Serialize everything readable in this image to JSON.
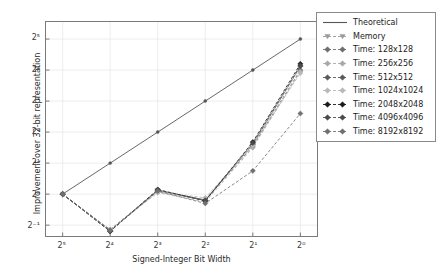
{
  "figure": {
    "background_color": "#ffffff",
    "axes_color": "#7a7a7a",
    "grid_color": "#e8e8e8"
  },
  "axis": {
    "xlabel": "Signed-Integer Bit Width",
    "ylabel": "Improvement over 32-bit representation",
    "xticks": [
      "2⁵",
      "2⁴",
      "2³",
      "2²",
      "2¹",
      "2⁰"
    ],
    "yticks": [
      "2⁵",
      "2⁴",
      "2³",
      "2²",
      "2¹",
      "2⁰",
      "2⁻¹"
    ]
  },
  "legend": {
    "position": "upper-right",
    "entries": [
      {
        "label": "Theoretical",
        "marker": "line",
        "color": "#555555"
      },
      {
        "label": "Memory",
        "marker": "triangle",
        "color": "#9a9a9a"
      },
      {
        "label": "Time: 128x128",
        "marker": "diamond",
        "color": "#6e6e6e"
      },
      {
        "label": "Time: 256x256",
        "marker": "diamond",
        "color": "#a8a8a8"
      },
      {
        "label": "Time: 512x512",
        "marker": "diamond",
        "color": "#5a5a5a"
      },
      {
        "label": "Time: 1024x1024",
        "marker": "diamond",
        "color": "#b8b8b8"
      },
      {
        "label": "Time: 2048x2048",
        "marker": "diamond",
        "color": "#1a1a1a"
      },
      {
        "label": "Time: 4096x4096",
        "marker": "diamond",
        "color": "#4a4a4a"
      },
      {
        "label": "Time: 8192x8192",
        "marker": "diamond",
        "color": "#707070"
      }
    ]
  },
  "chart_data": {
    "type": "line",
    "title": "",
    "xlabel": "Signed-Integer Bit Width",
    "ylabel": "Improvement over 32-bit representation",
    "xscale": "log2",
    "yscale": "log2",
    "x_reversed": true,
    "x": [
      32,
      16,
      8,
      4,
      2,
      1
    ],
    "x_tick_labels": [
      "2⁵",
      "2⁴",
      "2³",
      "2²",
      "2¹",
      "2⁰"
    ],
    "xlim_exp": [
      5.35,
      -0.35
    ],
    "ylim_exp": [
      -1.35,
      5.55
    ],
    "y_tick_labels": [
      "2⁻¹",
      "2⁰",
      "2¹",
      "2²",
      "2³",
      "2⁴",
      "2⁵"
    ],
    "grid": true,
    "legend_position": "upper-right",
    "series": [
      {
        "name": "Theoretical",
        "color": "#555555",
        "marker": "dot",
        "linestyle": "solid",
        "values_exp2": [
          0,
          1,
          2,
          3,
          4,
          5
        ]
      },
      {
        "name": "Memory",
        "color": "#9a9a9a",
        "marker": "triangle",
        "linestyle": "dashed",
        "values_exp2": [
          0,
          -1.15,
          0.12,
          -0.18,
          1.62,
          4.1
        ]
      },
      {
        "name": "Time: 128x128",
        "color": "#6e6e6e",
        "marker": "diamond",
        "linestyle": "dashed",
        "values_exp2": [
          0,
          -1.15,
          0.1,
          -0.2,
          1.55,
          4.0
        ]
      },
      {
        "name": "Time: 256x256",
        "color": "#a8a8a8",
        "marker": "diamond",
        "linestyle": "dashed",
        "values_exp2": [
          0,
          -1.15,
          0.05,
          -0.25,
          1.5,
          3.95
        ]
      },
      {
        "name": "Time: 512x512",
        "color": "#5a5a5a",
        "marker": "diamond",
        "linestyle": "dashed",
        "values_exp2": [
          0,
          -1.2,
          0.12,
          -0.2,
          1.6,
          4.12
        ]
      },
      {
        "name": "Time: 1024x1024",
        "color": "#b8b8b8",
        "marker": "diamond",
        "linestyle": "dashed",
        "values_exp2": [
          0,
          -1.18,
          0.08,
          -0.12,
          1.58,
          3.9
        ]
      },
      {
        "name": "Time: 2048x2048",
        "color": "#1a1a1a",
        "marker": "diamond",
        "linestyle": "dashed",
        "values_exp2": [
          0,
          -1.2,
          0.15,
          -0.22,
          1.68,
          4.2
        ]
      },
      {
        "name": "Time: 4096x4096",
        "color": "#4a4a4a",
        "marker": "diamond",
        "linestyle": "dashed",
        "values_exp2": [
          0,
          -1.18,
          0.13,
          -0.2,
          1.65,
          4.15
        ]
      },
      {
        "name": "Time: 8192x8192",
        "color": "#707070",
        "marker": "diamond",
        "linestyle": "dashed",
        "values_exp2": [
          0,
          -1.18,
          0.1,
          -0.3,
          0.75,
          2.6
        ]
      }
    ]
  }
}
